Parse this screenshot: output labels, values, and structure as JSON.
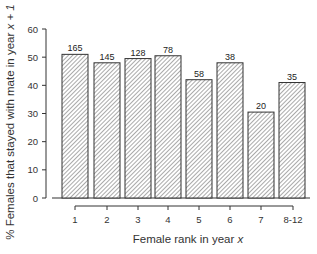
{
  "chart_data": {
    "type": "bar",
    "title": "",
    "xlabel": "Female rank in year x",
    "xlabel_parts": {
      "prefix": "Female rank in year ",
      "var": "x"
    },
    "ylabel": "% Females that stayed with mate in year x + 1",
    "ylabel_parts": {
      "prefix": "% Females that stayed with mate in year ",
      "var": "x + 1"
    },
    "categories": [
      "1",
      "2",
      "3",
      "4",
      "5",
      "6",
      "7",
      "8-12"
    ],
    "values": [
      51,
      48,
      49.5,
      50.5,
      42,
      48,
      30.5,
      41
    ],
    "bar_labels": [
      "165",
      "145",
      "128",
      "78",
      "58",
      "38",
      "20",
      "35"
    ],
    "ylim": [
      0,
      60
    ],
    "yticks": [
      0,
      10,
      20,
      30,
      40,
      50,
      60
    ],
    "grid": false,
    "legend": null,
    "bar_fill": "hatched",
    "colors": {
      "stroke": "#333333",
      "fill": "#ffffff",
      "hatch": "#555555"
    }
  }
}
